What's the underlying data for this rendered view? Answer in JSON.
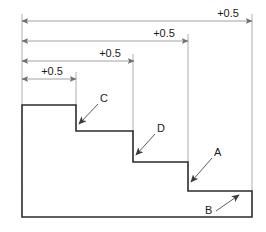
{
  "diagram": {
    "type": "engineering-step-profile",
    "colors": {
      "background": "#ffffff",
      "profile_stroke": "#2b2b2b",
      "dimension_stroke": "#8a8a8a",
      "extension_stroke": "#9a9a9a",
      "text": "#1a1a1a",
      "leader_stroke": "#4a4a4a"
    },
    "dimensions": [
      {
        "id": "dim-1",
        "label": "+0.5",
        "order": 1,
        "span": "outermost",
        "x_start": 22,
        "x_end": 252,
        "y": 21,
        "text_x": 228,
        "text_y": 17
      },
      {
        "id": "dim-2",
        "label": "+0.5",
        "order": 2,
        "span": "third-step",
        "x_start": 22,
        "x_end": 188,
        "y": 41,
        "text_x": 164,
        "text_y": 37
      },
      {
        "id": "dim-3",
        "label": "+0.5",
        "order": 3,
        "span": "second-step",
        "x_start": 22,
        "x_end": 134,
        "y": 61,
        "text_x": 110,
        "text_y": 57
      },
      {
        "id": "dim-4",
        "label": "+0.5",
        "order": 4,
        "span": "first-step",
        "x_start": 22,
        "x_end": 76,
        "y": 79,
        "text_x": 52,
        "text_y": 75
      }
    ],
    "callouts": [
      {
        "id": "callout-c",
        "label": "C",
        "text_x": 100,
        "text_y": 102,
        "leader_from_x": 98,
        "leader_from_y": 104,
        "leader_to_x": 79,
        "leader_to_y": 124,
        "target": "first-riser"
      },
      {
        "id": "callout-d",
        "label": "D",
        "text_x": 157,
        "text_y": 132,
        "leader_from_x": 155,
        "leader_from_y": 134,
        "leader_to_x": 136,
        "leader_to_y": 155,
        "target": "second-riser"
      },
      {
        "id": "callout-a",
        "label": "A",
        "text_x": 214,
        "text_y": 156,
        "leader_from_x": 212,
        "leader_from_y": 158,
        "leader_to_x": 191,
        "leader_to_y": 182,
        "target": "third-riser"
      },
      {
        "id": "callout-b",
        "label": "B",
        "text_x": 205,
        "text_y": 214,
        "leader_from_x": 216,
        "leader_from_y": 211,
        "leader_to_x": 239,
        "leader_to_y": 195,
        "target": "bottom-tread"
      }
    ],
    "profile_path": "M 22,105 L 76,105 L 76,131 L 133,131 L 133,162 L 188,162 L 188,191 L 252,191 L 252,217 L 22,217 Z",
    "extension_lines": [
      {
        "id": "ext-left",
        "x": 22,
        "y1": 14,
        "y2": 105
      },
      {
        "id": "ext-step1",
        "x": 76,
        "y1": 72,
        "y2": 105
      },
      {
        "id": "ext-step2",
        "x": 133,
        "y1": 54,
        "y2": 131
      },
      {
        "id": "ext-step3",
        "x": 188,
        "y1": 34,
        "y2": 162
      },
      {
        "id": "ext-right",
        "x": 252,
        "y1": 14,
        "y2": 191
      }
    ]
  }
}
